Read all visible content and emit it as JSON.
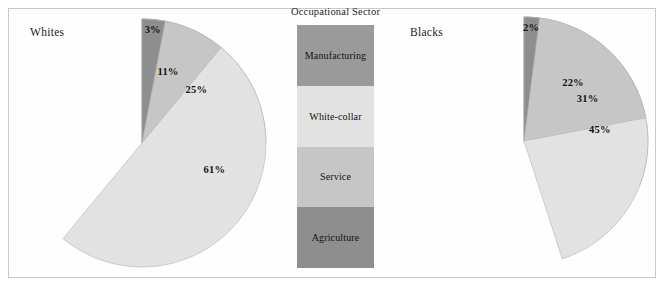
{
  "figure": {
    "width": 666,
    "height": 290,
    "background": "#ffffff",
    "frame_color": "#c9c9c9"
  },
  "legend": {
    "title": "Occupational Sector",
    "items": [
      {
        "label": "Manufacturing",
        "color": "#9a9a9a"
      },
      {
        "label": "White-collar",
        "color": "#e2e2e2"
      },
      {
        "label": "Service",
        "color": "#c6c6c6"
      },
      {
        "label": "Agriculture",
        "color": "#8e8e8e"
      }
    ]
  },
  "chart_data": [
    {
      "type": "pie",
      "title": "Whites",
      "categories": [
        "Manufacturing",
        "White-collar",
        "Service",
        "Agriculture"
      ],
      "values": [
        25,
        61,
        11,
        3
      ],
      "labels": [
        "25%",
        "61%",
        "11%",
        "3%"
      ],
      "colors": [
        "#9a9a9a",
        "#e2e2e2",
        "#c6c6c6",
        "#8e8e8e"
      ],
      "start_angle_deg": 0,
      "direction": "clockwise",
      "units": "percent",
      "legend_position": "center-shared"
    },
    {
      "type": "pie",
      "title": "Blacks",
      "categories": [
        "Manufacturing",
        "White-collar",
        "Service",
        "Agriculture"
      ],
      "values": [
        31,
        45,
        22,
        2
      ],
      "labels": [
        "31%",
        "45%",
        "22%",
        "2%"
      ],
      "colors": [
        "#9a9a9a",
        "#e2e2e2",
        "#c6c6c6",
        "#8e8e8e"
      ],
      "start_angle_deg": 0,
      "direction": "clockwise",
      "units": "percent",
      "legend_position": "center-shared"
    }
  ]
}
